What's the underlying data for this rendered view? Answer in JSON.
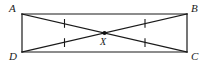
{
  "figure": {
    "background_color": "#ffffff",
    "stroke_color": "#1a1a1a",
    "labels": {
      "a": "A",
      "b": "B",
      "c": "C",
      "d": "D",
      "x": "X"
    },
    "shape": {
      "name": "rectangle",
      "vertices": {
        "A": {
          "x": 22,
          "y": 14
        },
        "B": {
          "x": 187,
          "y": 14
        },
        "C": {
          "x": 187,
          "y": 52
        },
        "D": {
          "x": 22,
          "y": 52
        }
      }
    },
    "diagonals": [
      {
        "name": "diagonal-ac",
        "from": "A",
        "to": "C"
      },
      {
        "name": "diagonal-bd",
        "from": "B",
        "to": "D"
      }
    ],
    "intersection_point": {
      "name": "X",
      "x": 104.5,
      "y": 33,
      "marker": "filled-dot",
      "radius": 2.1
    },
    "tick_marks": [
      {
        "segment": "A-X",
        "count": 1,
        "x": 64.5,
        "y": 23.4
      },
      {
        "segment": "X-B",
        "count": 1,
        "x": 145.0,
        "y": 23.4
      },
      {
        "segment": "D-X",
        "count": 1,
        "x": 64.5,
        "y": 42.6
      },
      {
        "segment": "X-C",
        "count": 1,
        "x": 145.0,
        "y": 42.6
      }
    ]
  }
}
